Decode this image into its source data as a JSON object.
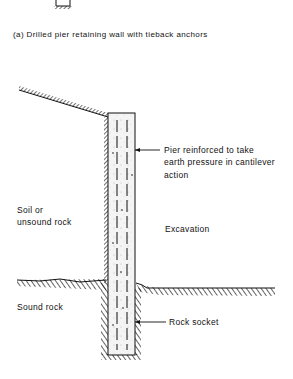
{
  "caption": "(a) Drilled pier retaining wall with tieback anchors",
  "labels": {
    "pier_note_line1": "Pier reinforced to take",
    "pier_note_line2": "earth pressure in cantilever",
    "pier_note_line3": "action",
    "soil_line1": "Soil or",
    "soil_line2": "unsound rock",
    "excavation": "Excavation",
    "sound_rock": "Sound rock",
    "rock_socket": "Rock socket"
  },
  "colors": {
    "ink": "#111111",
    "background": "#ffffff",
    "pier_fill": "#f3f3f3"
  }
}
